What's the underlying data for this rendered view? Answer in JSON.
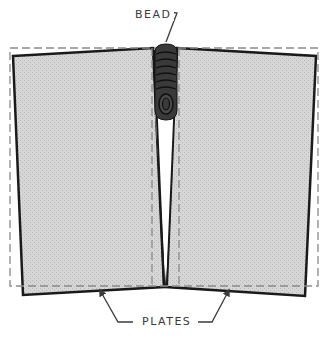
{
  "diagram": {
    "type": "weld-distortion-illustration",
    "labels": {
      "bead": "BEAD",
      "plates": "PLATES"
    },
    "parts": [
      {
        "id": "left-plate",
        "description": "Left plate tilted inward toward weld at top"
      },
      {
        "id": "right-plate",
        "description": "Right plate tilted inward toward weld at top"
      },
      {
        "id": "weld-bead",
        "description": "Multi-pass weld bead at top of joint"
      },
      {
        "id": "original-outline",
        "description": "Dashed outline showing original plate position"
      }
    ],
    "colors": {
      "plate_fill": "#d4d4d4",
      "plate_outline": "#1a1a1a",
      "dashed_outline": "#8a8a8a",
      "bead_fill": "#3a3a3a",
      "label_text": "#3a3a3a",
      "background": "#ffffff"
    }
  }
}
